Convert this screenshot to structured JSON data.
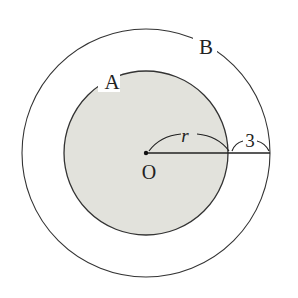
{
  "diagram": {
    "type": "concentric-circles",
    "center": {
      "label": "O",
      "x": 146,
      "y": 153
    },
    "inner_circle": {
      "label": "A",
      "radius_px": 83,
      "fill": "#e2e2dc",
      "stroke": "#333333"
    },
    "outer_circle": {
      "label": "B",
      "radius_px": 124,
      "fill": "none",
      "stroke": "#333333"
    },
    "inner_radius_label": "r",
    "gap_label": "3"
  }
}
